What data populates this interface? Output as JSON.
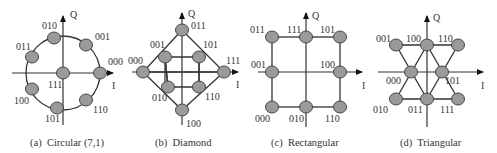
{
  "figure": {
    "panels": [
      {
        "id": "a",
        "caption": "(a)  Circular (7,1)",
        "axis_i": "I",
        "axis_q": "Q",
        "points": [
          {
            "label": "010",
            "x": 54,
            "y": 38,
            "lx": 42,
            "ly": 29
          },
          {
            "label": "001",
            "x": 86,
            "y": 45,
            "lx": 95,
            "ly": 40
          },
          {
            "label": "000",
            "x": 100,
            "y": 73,
            "lx": 108,
            "ly": 65
          },
          {
            "label": "110",
            "x": 86,
            "y": 100,
            "lx": 93,
            "ly": 113
          },
          {
            "label": "101",
            "x": 57,
            "y": 108,
            "lx": 45,
            "ly": 122
          },
          {
            "label": "100",
            "x": 32,
            "y": 89,
            "lx": 14,
            "ly": 104
          },
          {
            "label": "011",
            "x": 32,
            "y": 57,
            "lx": 16,
            "ly": 50
          },
          {
            "label": "111",
            "x": 63,
            "y": 73,
            "lx": 48,
            "ly": 88
          }
        ]
      },
      {
        "id": "b",
        "caption": "(b)  Diamond",
        "axis_i": "I",
        "axis_q": "Q",
        "points": [
          {
            "label": "011",
            "x": 182,
            "y": 30,
            "lx": 191,
            "ly": 29
          },
          {
            "label": "001",
            "x": 165,
            "y": 57,
            "lx": 150,
            "ly": 48
          },
          {
            "label": "101",
            "x": 199,
            "y": 57,
            "lx": 203,
            "ly": 48
          },
          {
            "label": "000",
            "x": 143,
            "y": 72,
            "lx": 128,
            "ly": 64
          },
          {
            "label": "111",
            "x": 224,
            "y": 72,
            "lx": 226,
            "ly": 64
          },
          {
            "label": "010",
            "x": 168,
            "y": 87,
            "lx": 152,
            "ly": 101
          },
          {
            "label": "110",
            "x": 199,
            "y": 87,
            "lx": 205,
            "ly": 100
          },
          {
            "label": "100",
            "x": 182,
            "y": 110,
            "lx": 186,
            "ly": 127
          }
        ]
      },
      {
        "id": "c",
        "caption": "(c)  Rectangular",
        "axis_i": "I",
        "axis_q": "Q",
        "points": [
          {
            "label": "011",
            "x": 272,
            "y": 37,
            "lx": 250,
            "ly": 33
          },
          {
            "label": "111",
            "x": 306,
            "y": 37,
            "lx": 287,
            "ly": 33
          },
          {
            "label": "101",
            "x": 340,
            "y": 37,
            "lx": 320,
            "ly": 33
          },
          {
            "label": "001",
            "x": 272,
            "y": 72,
            "lx": 251,
            "ly": 68
          },
          {
            "label": "100",
            "x": 340,
            "y": 72,
            "lx": 320,
            "ly": 68
          },
          {
            "label": "000",
            "x": 272,
            "y": 107,
            "lx": 255,
            "ly": 122
          },
          {
            "label": "010",
            "x": 306,
            "y": 107,
            "lx": 289,
            "ly": 122
          },
          {
            "label": "110",
            "x": 340,
            "y": 107,
            "lx": 325,
            "ly": 122
          }
        ]
      },
      {
        "id": "d",
        "caption": "(d)  Triangular",
        "axis_i": "I",
        "axis_q": "Q",
        "points": [
          {
            "label": "001",
            "x": 396,
            "y": 45,
            "lx": 376,
            "ly": 42
          },
          {
            "label": "100",
            "x": 427,
            "y": 45,
            "lx": 406,
            "ly": 42
          },
          {
            "label": "110",
            "x": 458,
            "y": 45,
            "lx": 438,
            "ly": 42
          },
          {
            "label": "000",
            "x": 411,
            "y": 72,
            "lx": 386,
            "ly": 84
          },
          {
            "label": "101",
            "x": 442,
            "y": 72,
            "lx": 445,
            "ly": 84
          },
          {
            "label": "010",
            "x": 396,
            "y": 99,
            "lx": 373,
            "ly": 113
          },
          {
            "label": "011",
            "x": 427,
            "y": 99,
            "lx": 408,
            "ly": 113
          },
          {
            "label": "111",
            "x": 458,
            "y": 99,
            "lx": 440,
            "ly": 113
          }
        ]
      }
    ]
  }
}
